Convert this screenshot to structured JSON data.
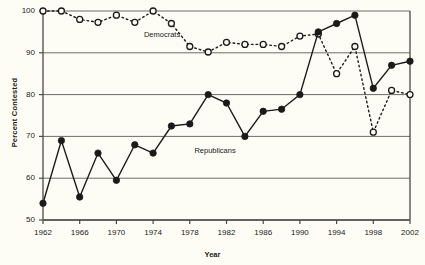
{
  "chart_data": {
    "type": "line",
    "title": "",
    "xlabel": "Year",
    "ylabel": "Percent Contested",
    "xlim": [
      1962,
      2002
    ],
    "ylim": [
      50,
      100
    ],
    "grid": true,
    "grid_axis": "y",
    "legend": "inline-annotations",
    "x": [
      1962,
      1964,
      1966,
      1968,
      1970,
      1972,
      1974,
      1976,
      1978,
      1980,
      1982,
      1984,
      1986,
      1988,
      1990,
      1992,
      1994,
      1996,
      1998,
      2000,
      2002
    ],
    "xticks": [
      1962,
      1966,
      1970,
      1974,
      1978,
      1982,
      1986,
      1990,
      1994,
      1998,
      2002
    ],
    "xtick_labels": [
      "1962",
      "1966",
      "1970",
      "1974",
      "1978",
      "1982",
      "1986",
      "1990",
      "1994",
      "1998",
      "2002"
    ],
    "yticks": [
      50,
      60,
      70,
      80,
      90,
      100
    ],
    "ytick_labels": [
      "50",
      "60",
      "70",
      "80",
      "90",
      "100"
    ],
    "series": [
      {
        "name": "Democrats",
        "marker": "open-circle",
        "linestyle": "dotted",
        "color": "#1a1a18",
        "label_x": 1973,
        "label_y": 94.2,
        "values": [
          100,
          100,
          98,
          97.3,
          99,
          97.3,
          100,
          97,
          91.5,
          90.2,
          92.5,
          92,
          92,
          91.5,
          94,
          94.5,
          85,
          91.5,
          71,
          81,
          80
        ]
      },
      {
        "name": "Republicans",
        "marker": "filled-circle",
        "linestyle": "solid",
        "color": "#1a1a18",
        "label_x": 1978.5,
        "label_y": 66.5,
        "values": [
          54,
          69,
          55.5,
          66,
          59.5,
          68,
          66,
          72.5,
          73,
          80,
          78,
          70,
          76,
          76.5,
          80,
          95,
          97,
          99,
          81.5,
          87,
          88
        ]
      }
    ]
  }
}
